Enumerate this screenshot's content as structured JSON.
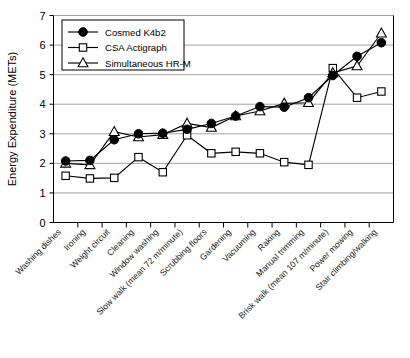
{
  "chart_data": {
    "type": "line",
    "title": "",
    "xlabel": "",
    "ylabel": "Energy Expenditure (METs)",
    "ylim": [
      0,
      7
    ],
    "yticks": [
      0,
      1,
      2,
      3,
      4,
      5,
      6,
      7
    ],
    "grid": true,
    "legend_position": "top-left",
    "categories": [
      "Washing dishes",
      "Ironing",
      "Weight circuit",
      "Cleaning",
      "Window washing",
      "Slow walk (mean 72 m/minute)",
      "Scrubbing floors",
      "Gardening",
      "Vacuuming",
      "Raking",
      "Manual trimming",
      "Brisk walk (mean 107 m/minute)",
      "Power mowing",
      "Stair climbing/walking"
    ],
    "series": [
      {
        "name": "Cosmed K4b2",
        "marker": "filled-circle",
        "values": [
          2.08,
          2.1,
          2.8,
          3.0,
          3.02,
          3.15,
          3.35,
          3.6,
          3.92,
          3.9,
          4.22,
          4.97,
          5.62,
          6.08
        ]
      },
      {
        "name": "CSA Actigraph",
        "marker": "open-square",
        "values": [
          1.58,
          1.49,
          1.51,
          2.21,
          1.7,
          2.95,
          2.34,
          2.39,
          2.34,
          2.04,
          1.95,
          5.22,
          4.22,
          4.43
        ]
      },
      {
        "name": "Simultaneous HR-M",
        "marker": "open-triangle",
        "values": [
          2.0,
          1.95,
          3.07,
          2.89,
          2.97,
          3.35,
          3.21,
          3.6,
          3.77,
          4.03,
          4.05,
          5.06,
          5.29,
          6.4
        ]
      }
    ]
  },
  "legend": {
    "entries": [
      {
        "label": "Cosmed K4b2",
        "marker": "filled-circle"
      },
      {
        "label": "CSA Actigraph",
        "marker": "open-square"
      },
      {
        "label": "Simultaneous HR-M",
        "marker": "open-triangle"
      }
    ]
  }
}
